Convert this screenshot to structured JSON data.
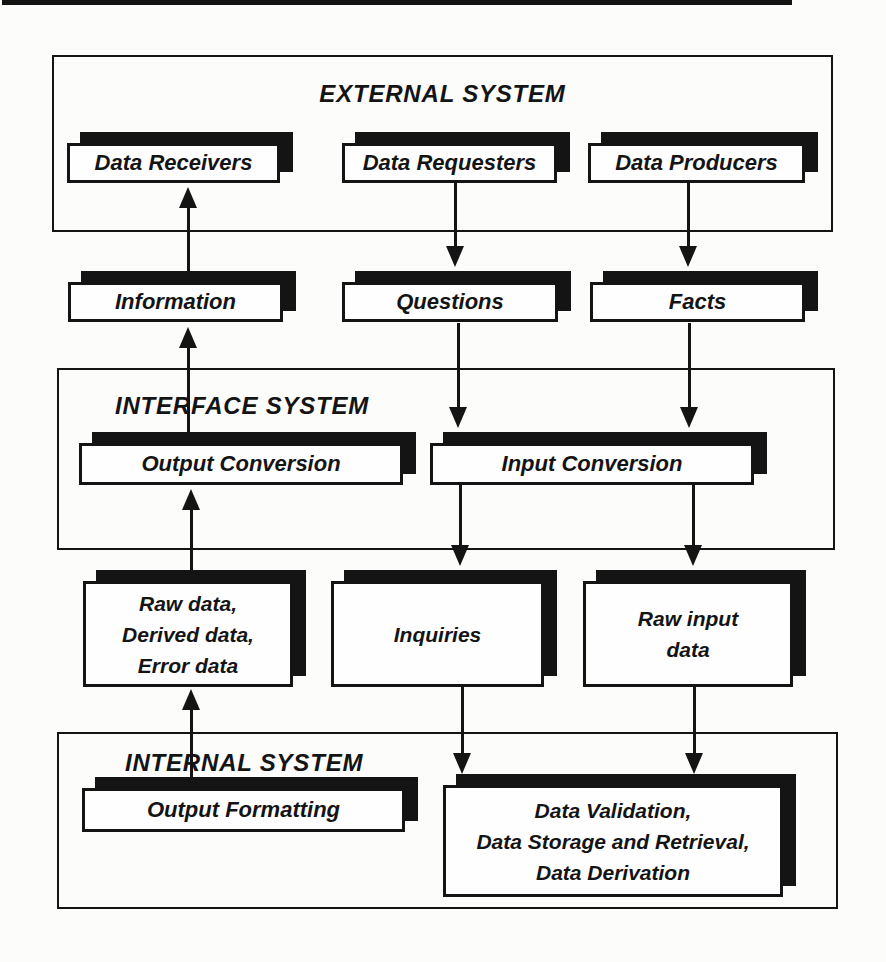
{
  "figure": {
    "ink_color": "#141414",
    "paper_color": "#fcfcfa",
    "external": {
      "title": "EXTERNAL SYSTEM",
      "data_receivers": "Data Receivers",
      "data_requesters": "Data Requesters",
      "data_producers": "Data Producers"
    },
    "flows_upper": {
      "information": "Information",
      "questions": "Questions",
      "facts": "Facts"
    },
    "interface": {
      "title": "INTERFACE SYSTEM",
      "output_conversion": "Output Conversion",
      "input_conversion": "Input Conversion"
    },
    "flows_lower": {
      "output_data_lines": [
        "Raw data,",
        "Derived data,",
        "Error data"
      ],
      "inquiries": "Inquiries",
      "raw_input_lines": [
        "Raw input",
        "data"
      ]
    },
    "internal": {
      "title": "INTERNAL SYSTEM",
      "output_formatting": "Output Formatting",
      "processing_lines": [
        "Data Validation,",
        "Data Storage and Retrieval,",
        "Data Derivation"
      ]
    }
  }
}
